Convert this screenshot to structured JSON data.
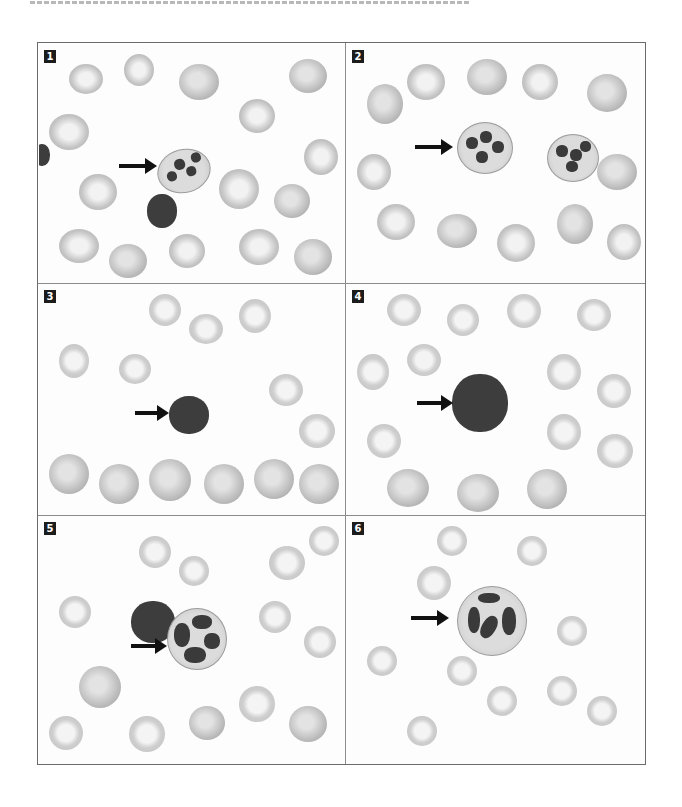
{
  "figure": {
    "top_caption_fragment": "",
    "panels": [
      {
        "label": "1",
        "arrow": "arrow-pointing-to-cell"
      },
      {
        "label": "2",
        "arrow": "arrow-pointing-to-cell"
      },
      {
        "label": "3",
        "arrow": "arrow-pointing-to-cell"
      },
      {
        "label": "4",
        "arrow": "arrow-pointing-to-cell"
      },
      {
        "label": "5",
        "arrow": "arrow-pointing-to-cell"
      },
      {
        "label": "6",
        "arrow": "arrow-pointing-to-cell"
      }
    ],
    "colors": {
      "frame": "#6b6b6b",
      "label_bg": "#1c1c1c",
      "label_text": "#ffffff",
      "arrow": "#111111",
      "nucleus": "#3a3a3a"
    }
  }
}
